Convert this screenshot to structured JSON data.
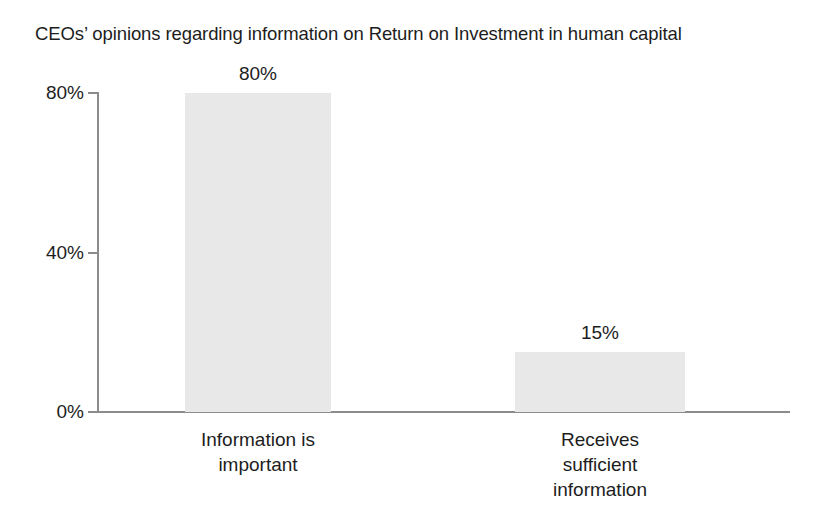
{
  "chart_data": {
    "type": "bar",
    "title": "CEOs’ opinions regarding information on Return on Investment in human capital",
    "xlabel": "",
    "ylabel": "",
    "categories": [
      "Information is important",
      "Receives sufficient information"
    ],
    "category_lines": [
      [
        "Information is",
        "important"
      ],
      [
        "Receives",
        "sufficient",
        "information"
      ]
    ],
    "values": [
      80,
      15
    ],
    "value_labels": [
      "80%",
      "15%"
    ],
    "ylim": [
      0,
      80
    ],
    "yticks": [
      0,
      40,
      80
    ],
    "ytick_labels": [
      "0%",
      "40%",
      "80%"
    ],
    "grid": false,
    "legend": false,
    "legend_position": "none",
    "units": "percent",
    "bar_color": "#e8e8e8",
    "axis_color": "#8c8c8c",
    "text_color": "#1d1d1d",
    "background_color": "#ffffff"
  }
}
